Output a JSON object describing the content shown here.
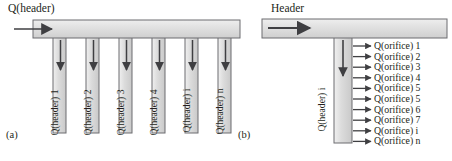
{
  "figure": {
    "width": 452,
    "height": 161,
    "background": "#ffffff",
    "stroke_color": "#58585b",
    "fill_color": "#dcdcdc",
    "arrow_color": "#3f3f42",
    "text_color": "#231f20"
  },
  "panel_a": {
    "caption": "(a)",
    "inlet_label": "Q(header)",
    "header_bar": {
      "x": 33,
      "y": 20,
      "width": 207,
      "height": 18
    },
    "inlet_arrow": {
      "from_x": 14,
      "to_x": 56,
      "y": 29
    },
    "downcomer_labels": [
      "Q(header) 1",
      "Q(header) 2",
      "Q(header) 3",
      "Q(header) 4",
      "Q(header) i",
      "Q(header) n"
    ],
    "downcomers": [
      {
        "x": 53,
        "y": 38,
        "width": 13,
        "height": 95
      },
      {
        "x": 86,
        "y": 38,
        "width": 13,
        "height": 95
      },
      {
        "x": 119,
        "y": 38,
        "width": 13,
        "height": 95
      },
      {
        "x": 152,
        "y": 38,
        "width": 13,
        "height": 95
      },
      {
        "x": 185,
        "y": 38,
        "width": 13,
        "height": 95
      },
      {
        "x": 218,
        "y": 38,
        "width": 13,
        "height": 95
      }
    ]
  },
  "panel_b": {
    "caption": "(b)",
    "header_label": "Header",
    "header_bar": {
      "x": 262,
      "y": 19,
      "width": 185,
      "height": 19
    },
    "inlet_arrow": {
      "from_x": 268,
      "to_x": 314,
      "y": 28
    },
    "downcomer_label": "Q(header) i",
    "downcomer": {
      "x": 334,
      "y": 38,
      "width": 18,
      "height": 105
    },
    "orifice_labels": [
      "Q(orifice) 1",
      "Q(orifice) 2",
      "Q(orifice) 3",
      "Q(orifice) 4",
      "Q(orifice) 5",
      "Q(orifice) 5",
      "Q(orifice) 6",
      "Q(orifice) 7",
      "Q(orifice) i",
      "Q(orifice) n"
    ]
  }
}
